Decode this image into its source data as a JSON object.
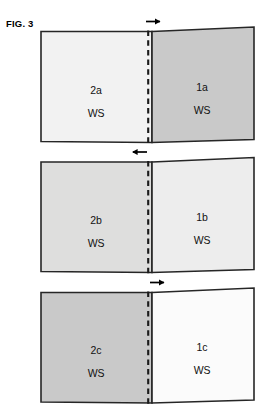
{
  "figure": {
    "label": "FIG. 3",
    "background_color": "#ffffff",
    "outline_color": "#222222",
    "dashed_line_color": "#1a1a1a",
    "arrow_color": "#000000"
  },
  "panels": [
    {
      "id": "panel-a",
      "arrow": {
        "name": "arrow-right-icon",
        "direction": "right",
        "glyph": "→"
      },
      "left_block": {
        "id": "block-2a",
        "label": "2a",
        "sublabel": "WS",
        "fill": "#f2f2f2"
      },
      "right_block": {
        "id": "block-1a",
        "label": "1a",
        "sublabel": "WS",
        "fill": "#c9c9c9"
      }
    },
    {
      "id": "panel-b",
      "arrow": {
        "name": "arrow-left-icon",
        "direction": "left",
        "glyph": "←"
      },
      "left_block": {
        "id": "block-2b",
        "label": "2b",
        "sublabel": "WS",
        "fill": "#dededd"
      },
      "right_block": {
        "id": "block-1b",
        "label": "1b",
        "sublabel": "WS",
        "fill": "#ededed"
      }
    },
    {
      "id": "panel-c",
      "arrow": {
        "name": "arrow-right-icon",
        "direction": "right",
        "glyph": "→"
      },
      "left_block": {
        "id": "block-2c",
        "label": "2c",
        "sublabel": "WS",
        "fill": "#c9c9c9"
      },
      "right_block": {
        "id": "block-1c",
        "label": "1c",
        "sublabel": "WS",
        "fill": "#fbfbfb"
      }
    }
  ]
}
